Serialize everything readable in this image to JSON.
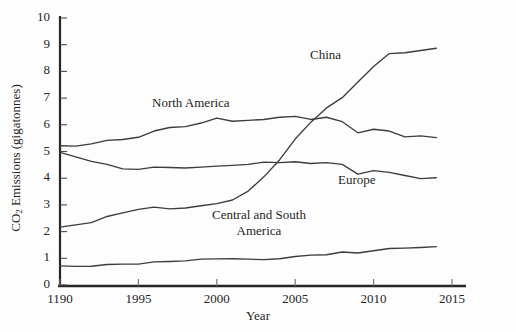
{
  "chart_data": {
    "type": "line",
    "title": "",
    "xlabel": "Year",
    "ylabel": "CO2 Emissions (gigatonnes)",
    "ylabel_prefix": "CO",
    "ylabel_sub": "2",
    "ylabel_suffix": " Emissions (gigatonnes)",
    "xlim": [
      1990,
      2015
    ],
    "ylim": [
      0,
      10
    ],
    "grid": false,
    "legend_position": "inline-annotations",
    "x_tick_labels": [
      "1190",
      "1995",
      "2000",
      "2005",
      "2010",
      "2015"
    ],
    "x_tick_values": [
      1990,
      1995,
      2000,
      2005,
      2010,
      2015
    ],
    "y_tick_labels": [
      "0",
      "1",
      "2",
      "3",
      "4",
      "5",
      "6",
      "7",
      "8",
      "9",
      "10"
    ],
    "y_tick_values": [
      0,
      1,
      2,
      3,
      4,
      5,
      6,
      7,
      8,
      9,
      10
    ],
    "x": [
      1990,
      1991,
      1992,
      1993,
      1994,
      1995,
      1996,
      1997,
      1998,
      1999,
      2000,
      2001,
      2002,
      2003,
      2004,
      2005,
      2006,
      2007,
      2008,
      2009,
      2010,
      2011,
      2012,
      2013,
      2014
    ],
    "series": [
      {
        "name": "China",
        "label": "China",
        "color": "#3d3d3d",
        "values": [
          2.15,
          2.25,
          2.35,
          2.55,
          2.7,
          2.85,
          2.9,
          2.85,
          2.9,
          2.95,
          3.05,
          3.2,
          3.5,
          4.05,
          4.7,
          5.45,
          6.1,
          6.65,
          7.0,
          7.6,
          8.2,
          8.65,
          8.7,
          8.8,
          8.85
        ]
      },
      {
        "name": "North America",
        "label": "North America",
        "color": "#3d3d3d",
        "values": [
          5.2,
          5.2,
          5.3,
          5.4,
          5.45,
          5.55,
          5.75,
          5.9,
          5.95,
          6.05,
          6.25,
          6.15,
          6.15,
          6.2,
          6.3,
          6.3,
          6.2,
          6.3,
          6.1,
          5.7,
          5.85,
          5.75,
          5.55,
          5.6,
          5.5
        ]
      },
      {
        "name": "Europe",
        "label": "Europe",
        "color": "#3d3d3d",
        "values": [
          4.95,
          4.8,
          4.65,
          4.5,
          4.35,
          4.35,
          4.4,
          4.4,
          4.4,
          4.4,
          4.45,
          4.5,
          4.5,
          4.6,
          4.6,
          4.6,
          4.55,
          4.6,
          4.5,
          4.15,
          4.3,
          4.2,
          4.1,
          4.0,
          4.0
        ]
      },
      {
        "name": "Central and South America",
        "label": "Central and South\nAmerica",
        "label_line1": "Central and South",
        "label_line2": "America",
        "color": "#3d3d3d",
        "values": [
          0.7,
          0.7,
          0.72,
          0.75,
          0.78,
          0.8,
          0.85,
          0.88,
          0.92,
          0.95,
          0.98,
          1.0,
          0.95,
          0.95,
          1.0,
          1.05,
          1.12,
          1.15,
          1.22,
          1.2,
          1.3,
          1.35,
          1.38,
          1.42,
          1.42
        ]
      }
    ]
  },
  "axes": {
    "y_axis_title_full": "CO2 Emissions (gigatonnes)",
    "x_axis_title": "Year"
  },
  "title_strip": {
    "text": ""
  }
}
